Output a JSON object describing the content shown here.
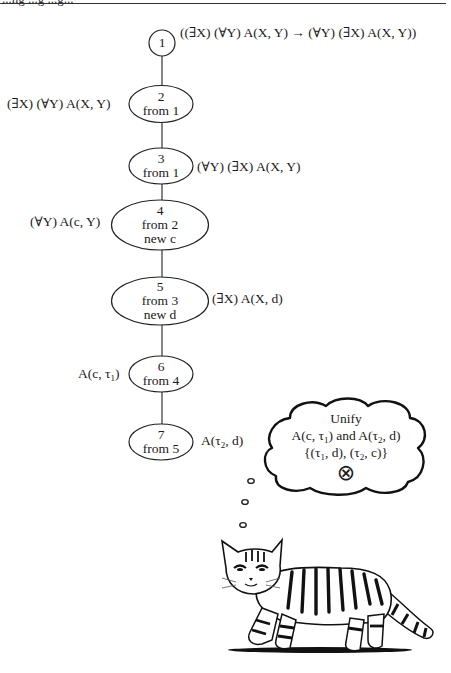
{
  "header": {
    "clipped_heading": "...ng ...g ...g..."
  },
  "tree": {
    "nodes": [
      {
        "id": "1",
        "label": "1",
        "lines": [
          "1"
        ],
        "formula": "((∃X) (∀Y) A(X, Y) → (∀Y) (∃X) A(X, Y))",
        "formula_side": "right"
      },
      {
        "id": "2",
        "lines": [
          "2",
          "from 1"
        ],
        "formula": "(∃X) (∀Y) A(X, Y)",
        "formula_side": "left"
      },
      {
        "id": "3",
        "lines": [
          "3",
          "from 1"
        ],
        "formula": "(∀Y) (∃X) A(X, Y)",
        "formula_side": "right"
      },
      {
        "id": "4",
        "lines": [
          "4",
          "from 2",
          "new c"
        ],
        "formula": "(∀Y) A(c, Y)",
        "formula_side": "left"
      },
      {
        "id": "5",
        "lines": [
          "5",
          "from 3",
          "new d"
        ],
        "formula": "(∃X) A(X, d)",
        "formula_side": "right"
      },
      {
        "id": "6",
        "lines": [
          "6",
          "from 4"
        ],
        "formula_prefix": "A(c, τ",
        "formula_sub": "1",
        "formula_suffix": ")",
        "formula_side": "left"
      },
      {
        "id": "7",
        "lines": [
          "7",
          "from 5"
        ],
        "formula_prefix": "A(τ",
        "formula_sub": "2",
        "formula_suffix": ", d)",
        "formula_side": "right"
      }
    ]
  },
  "thought_bubble": {
    "line1": "Unify",
    "line2_a": "A(c, τ",
    "line2_sub1": "1",
    "line2_b": ") and A(τ",
    "line2_sub2": "2",
    "line2_c": ", d)",
    "line3_a": "{(τ",
    "line3_sub1": "1",
    "line3_b": ", d), (τ",
    "line3_sub2": "2",
    "line3_c": ", c)}",
    "result_icon": "circled-times-icon",
    "result_symbol": "⊗"
  },
  "illustration": {
    "subject": "tabby-cat-icon"
  }
}
